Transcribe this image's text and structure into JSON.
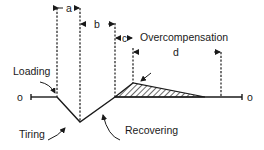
{
  "diagram": {
    "type": "supercompensation-curve",
    "labels": {
      "loading": "Loading",
      "tiring": "Tiring",
      "recovering": "Recovering",
      "overcompensation": "Overcompensation",
      "baseline_start": "o",
      "baseline_end": "o"
    },
    "intervals": [
      {
        "id": "a",
        "label": "a"
      },
      {
        "id": "b",
        "label": "b"
      },
      {
        "id": "c",
        "label": "c"
      },
      {
        "id": "d",
        "label": "d"
      }
    ],
    "colors": {
      "line": "#1a1a1a",
      "background": "#ffffff"
    }
  }
}
